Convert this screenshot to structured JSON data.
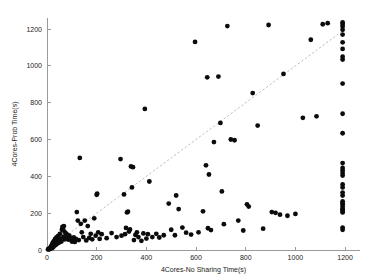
{
  "chart_data": {
    "type": "scatter",
    "title": "",
    "xlabel": "4Cores-No Sharing Time(s)",
    "ylabel": "4Cores-Prob Time(s)",
    "xlim": [
      0,
      1260
    ],
    "ylim": [
      0,
      1260
    ],
    "xticks": [
      0,
      200,
      400,
      600,
      800,
      1000,
      1200
    ],
    "yticks": [
      0,
      200,
      400,
      600,
      800,
      1000,
      1200
    ],
    "xticklabels": [
      "0",
      "200",
      "400",
      "600",
      "800",
      "1000",
      "1200"
    ],
    "yticklabels": [
      "0",
      "200",
      "400",
      "600",
      "800",
      "1000",
      "1200"
    ],
    "grid": false,
    "legend": null,
    "marker": "filled-circle",
    "marker_color": "#0b0b0b",
    "marker_size_px": 2.4,
    "reference_line": {
      "name": "y = x diagonal",
      "style": "dashed",
      "color": "#b4b4b4",
      "from": [
        0,
        0
      ],
      "to": [
        1200,
        1200
      ]
    },
    "series": [
      {
        "name": "benchmarks",
        "points": [
          [
            4,
            3
          ],
          [
            6,
            5
          ],
          [
            8,
            7
          ],
          [
            9,
            4
          ],
          [
            11,
            9
          ],
          [
            12,
            6
          ],
          [
            13,
            12
          ],
          [
            14,
            8
          ],
          [
            15,
            16
          ],
          [
            16,
            11
          ],
          [
            17,
            20
          ],
          [
            18,
            14
          ],
          [
            19,
            25
          ],
          [
            20,
            10
          ],
          [
            21,
            30
          ],
          [
            22,
            18
          ],
          [
            23,
            38
          ],
          [
            24,
            22
          ],
          [
            25,
            15
          ],
          [
            26,
            45
          ],
          [
            27,
            28
          ],
          [
            28,
            33
          ],
          [
            30,
            52
          ],
          [
            31,
            24
          ],
          [
            33,
            60
          ],
          [
            34,
            41
          ],
          [
            36,
            29
          ],
          [
            38,
            68
          ],
          [
            40,
            48
          ],
          [
            42,
            35
          ],
          [
            44,
            75
          ],
          [
            46,
            55
          ],
          [
            48,
            40
          ],
          [
            52,
            88
          ],
          [
            55,
            62
          ],
          [
            58,
            46
          ],
          [
            60,
            110
          ],
          [
            62,
            126
          ],
          [
            64,
            118
          ],
          [
            66,
            72
          ],
          [
            68,
            130
          ],
          [
            70,
            100
          ],
          [
            72,
            58
          ],
          [
            75,
            92
          ],
          [
            78,
            68
          ],
          [
            82,
            84
          ],
          [
            86,
            56
          ],
          [
            90,
            78
          ],
          [
            95,
            64
          ],
          [
            100,
            46
          ],
          [
            104,
            48
          ],
          [
            108,
            68
          ],
          [
            112,
            44
          ],
          [
            116,
            60
          ],
          [
            120,
            206
          ],
          [
            124,
            160
          ],
          [
            128,
            54
          ],
          [
            132,
            500
          ],
          [
            136,
            142
          ],
          [
            140,
            96
          ],
          [
            146,
            70
          ],
          [
            152,
            160
          ],
          [
            158,
            52
          ],
          [
            164,
            130
          ],
          [
            170,
            66
          ],
          [
            176,
            88
          ],
          [
            182,
            58
          ],
          [
            190,
            172
          ],
          [
            196,
            78
          ],
          [
            200,
            300
          ],
          [
            202,
            306
          ],
          [
            206,
            96
          ],
          [
            212,
            60
          ],
          [
            220,
            86
          ],
          [
            240,
            64
          ],
          [
            260,
            92
          ],
          [
            280,
            70
          ],
          [
            296,
            494
          ],
          [
            300,
            78
          ],
          [
            310,
            302
          ],
          [
            314,
            86
          ],
          [
            318,
            120
          ],
          [
            322,
            204
          ],
          [
            326,
            208
          ],
          [
            330,
            100
          ],
          [
            334,
            112
          ],
          [
            338,
            454
          ],
          [
            342,
            340
          ],
          [
            346,
            450
          ],
          [
            350,
            54
          ],
          [
            356,
            82
          ],
          [
            362,
            96
          ],
          [
            368,
            70
          ],
          [
            380,
            50
          ],
          [
            388,
            90
          ],
          [
            394,
            766
          ],
          [
            400,
            62
          ],
          [
            406,
            86
          ],
          [
            412,
            372
          ],
          [
            424,
            70
          ],
          [
            440,
            88
          ],
          [
            452,
            68
          ],
          [
            470,
            80
          ],
          [
            490,
            252
          ],
          [
            500,
            110
          ],
          [
            515,
            80
          ],
          [
            520,
            296
          ],
          [
            530,
            222
          ],
          [
            545,
            122
          ],
          [
            560,
            94
          ],
          [
            580,
            84
          ],
          [
            596,
            1130
          ],
          [
            610,
            96
          ],
          [
            628,
            210
          ],
          [
            640,
            460
          ],
          [
            645,
            938
          ],
          [
            648,
            118
          ],
          [
            652,
            410
          ],
          [
            660,
            108
          ],
          [
            672,
            586
          ],
          [
            690,
            942
          ],
          [
            698,
            690
          ],
          [
            704,
            318
          ],
          [
            712,
            140
          ],
          [
            726,
            1216
          ],
          [
            740,
            600
          ],
          [
            755,
            596
          ],
          [
            770,
            160
          ],
          [
            790,
            106
          ],
          [
            805,
            248
          ],
          [
            812,
            236
          ],
          [
            828,
            852
          ],
          [
            848,
            676
          ],
          [
            870,
            116
          ],
          [
            892,
            1222
          ],
          [
            905,
            206
          ],
          [
            920,
            202
          ],
          [
            938,
            192
          ],
          [
            952,
            956
          ],
          [
            968,
            186
          ],
          [
            1000,
            196
          ],
          [
            1030,
            718
          ],
          [
            1062,
            1142
          ],
          [
            1085,
            726
          ],
          [
            1110,
            1226
          ],
          [
            1130,
            1232
          ],
          [
            1190,
            110
          ],
          [
            1190,
            122
          ],
          [
            1190,
            204
          ],
          [
            1190,
            212
          ],
          [
            1190,
            218
          ],
          [
            1190,
            224
          ],
          [
            1190,
            236
          ],
          [
            1190,
            248
          ],
          [
            1190,
            256
          ],
          [
            1190,
            264
          ],
          [
            1190,
            296
          ],
          [
            1190,
            312
          ],
          [
            1190,
            340
          ],
          [
            1190,
            356
          ],
          [
            1190,
            404
          ],
          [
            1190,
            418
          ],
          [
            1190,
            432
          ],
          [
            1190,
            446
          ],
          [
            1190,
            472
          ],
          [
            1190,
            634
          ],
          [
            1190,
            740
          ],
          [
            1190,
            904
          ],
          [
            1190,
            1034
          ],
          [
            1190,
            1050
          ],
          [
            1190,
            1092
          ],
          [
            1190,
            1128
          ],
          [
            1190,
            1170
          ],
          [
            1190,
            1196
          ],
          [
            1190,
            1214
          ],
          [
            1190,
            1228
          ],
          [
            1190,
            1236
          ]
        ]
      }
    ]
  },
  "axes": {
    "x_label": "4Cores-No Sharing Time(s)",
    "y_label": "4Cores-Prob Time(s)"
  }
}
